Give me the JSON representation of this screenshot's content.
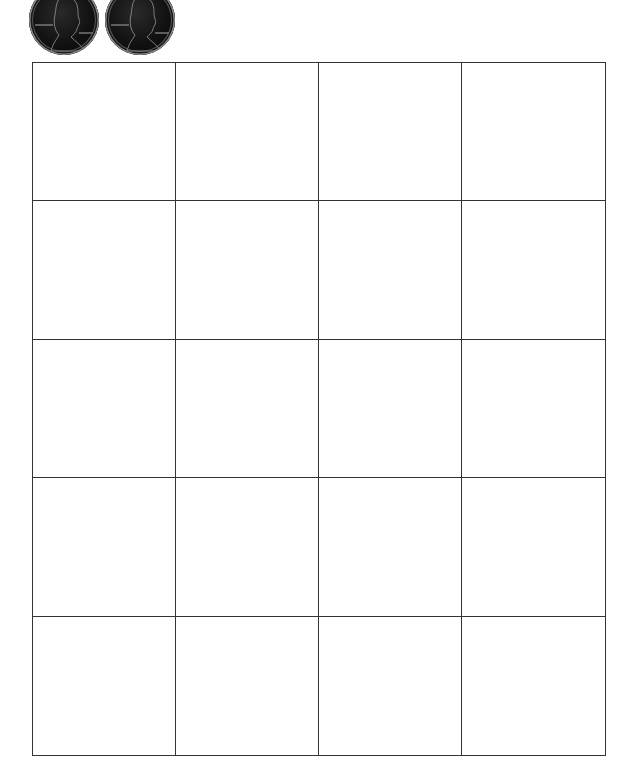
{
  "worksheet": {
    "coins": [
      {
        "name": "penny",
        "label": "LIBERTY",
        "year": "1978"
      },
      {
        "name": "penny",
        "label": "LIBERTY",
        "year": "1978"
      }
    ],
    "grid": {
      "columns": 4,
      "rows": 5,
      "line_color": "#333333"
    }
  }
}
